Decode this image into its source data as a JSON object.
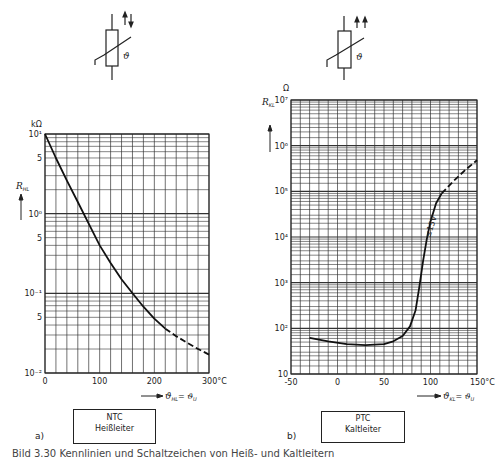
{
  "chart_data": [
    {
      "type": "line",
      "panel": "a)",
      "title": "NTC Heißleiter",
      "box_lines": [
        "NTC",
        "Heißleiter"
      ],
      "symbol_arrows": "opposite (↑↓)",
      "symbol_label": "ϑ",
      "xlabel": "ϑHL = ϑU",
      "xunit": "°C",
      "ylabel": "RHL",
      "yunit": "kΩ",
      "yscale": "log",
      "xlim": [
        0,
        300
      ],
      "ylim": [
        0.01,
        10
      ],
      "xticks": [
        0,
        100,
        200,
        300
      ],
      "xtick_labels": [
        "0",
        "100",
        "200",
        "300°C"
      ],
      "yticks": [
        10,
        5,
        1,
        0.5,
        0.1,
        0.05,
        0.01
      ],
      "ytick_labels": [
        "10¹",
        "5",
        "10⁰",
        "5",
        "10⁻¹",
        "5",
        "10⁻²"
      ],
      "grid": true,
      "series": [
        {
          "name": "NTC solid",
          "style": "solid",
          "x": [
            0,
            20,
            40,
            60,
            80,
            100,
            120,
            140,
            160,
            180,
            200,
            220
          ],
          "y": [
            10,
            5.0,
            2.6,
            1.4,
            0.75,
            0.4,
            0.24,
            0.15,
            0.1,
            0.068,
            0.048,
            0.036
          ]
        },
        {
          "name": "NTC extrapolated",
          "style": "dashed",
          "x": [
            220,
            240,
            260,
            280,
            300
          ],
          "y": [
            0.036,
            0.029,
            0.024,
            0.02,
            0.017
          ]
        }
      ]
    },
    {
      "type": "line",
      "panel": "b)",
      "title": "PTC Kaltleiter",
      "box_lines": [
        "PTC",
        "Kaltleiter"
      ],
      "symbol_arrows": "same direction (↑↑)",
      "symbol_label": "ϑ",
      "xlabel": "ϑKL = ϑU",
      "xunit": "°C",
      "ylabel": "RKL",
      "yunit": "Ω",
      "yscale": "log",
      "xlim": [
        -50,
        150
      ],
      "ylim": [
        10,
        10000000
      ],
      "xticks": [
        -50,
        0,
        50,
        100,
        150
      ],
      "xtick_labels": [
        "-50",
        "0",
        "50",
        "100",
        "150°C"
      ],
      "yticks": [
        10,
        100,
        1000,
        10000,
        100000,
        1000000,
        10000000
      ],
      "ytick_labels": [
        "10",
        "10²",
        "10³",
        "10⁴",
        "10⁵",
        "10⁶",
        "10⁷"
      ],
      "grid": true,
      "annotation": "≤15V",
      "series": [
        {
          "name": "PTC solid",
          "style": "solid",
          "x": [
            -30,
            -10,
            10,
            30,
            50,
            60,
            70,
            78,
            84,
            88,
            92,
            96,
            100,
            106,
            112
          ],
          "y": [
            62,
            52,
            45,
            43,
            45,
            52,
            68,
            110,
            250,
            800,
            3000,
            9000,
            22000,
            55000,
            90000
          ]
        },
        {
          "name": "PTC extrapolated",
          "style": "dashed",
          "x": [
            112,
            125,
            138,
            150
          ],
          "y": [
            90000,
            170000,
            300000,
            480000
          ]
        }
      ]
    }
  ],
  "left": {
    "unit_label": "kΩ",
    "y_axis_label": "R",
    "y_axis_sub": "HL",
    "x_axis_label": "ϑ",
    "x_axis_sub": "HL",
    "x_axis_eq": "= ϑ",
    "x_axis_eq_sub": "U",
    "box_line1": "NTC",
    "box_line2": "Heißleiter",
    "panel": "a)"
  },
  "right": {
    "unit_label": "Ω",
    "y_axis_label": "R",
    "y_axis_sub": "KL",
    "x_axis_label": "ϑ",
    "x_axis_sub": "KL",
    "x_axis_eq": "= ϑ",
    "x_axis_eq_sub": "U",
    "box_line1": "PTC",
    "box_line2": "Kaltleiter",
    "panel": "b)",
    "annotation": "≤15V"
  },
  "caption": "Bild 3.30  Kennlinien und Schaltzeichen von Heiß- und Kaltleitern"
}
